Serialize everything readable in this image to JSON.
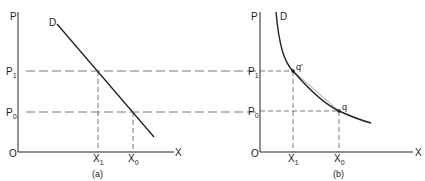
{
  "figure": {
    "panels": [
      {
        "id": "a",
        "caption": "(a)",
        "y_axis_label": "P",
        "x_axis_label": "X",
        "origin_label": "O",
        "curve_label": "D",
        "curve_type": "linear demand",
        "price_ticks": [
          {
            "base": "P",
            "sub": "1"
          },
          {
            "base": "P",
            "sub": "0"
          }
        ],
        "quantity_ticks": [
          {
            "base": "X",
            "sub": "1"
          },
          {
            "base": "X",
            "sub": "0"
          }
        ]
      },
      {
        "id": "b",
        "caption": "(b)",
        "y_axis_label": "P",
        "x_axis_label": "X",
        "origin_label": "O",
        "curve_label": "D",
        "curve_type": "convex demand (rectangular hyperbola)",
        "price_ticks": [
          {
            "base": "P",
            "sub": "1"
          },
          {
            "base": "P",
            "sub": "0"
          }
        ],
        "quantity_ticks": [
          {
            "base": "X",
            "sub": "1"
          },
          {
            "base": "X",
            "sub": "0"
          }
        ],
        "points": [
          {
            "label": "q′"
          },
          {
            "label": "q"
          }
        ]
      }
    ],
    "colors": {
      "ink": "#222222",
      "dash": "#555555",
      "background": "#ffffff"
    }
  }
}
